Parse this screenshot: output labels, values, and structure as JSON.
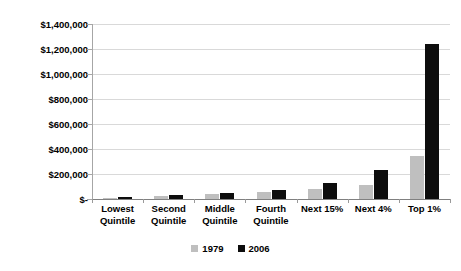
{
  "chart_data": {
    "type": "bar",
    "title": "",
    "subtitle": "",
    "xlabel": "",
    "ylabel": "",
    "categories": [
      "Lowest Quintile",
      "Second Quintile",
      "Middle Quintile",
      "Fourth Quintile",
      "Next 15%",
      "Next 4%",
      "Top 1%"
    ],
    "category_lines": [
      [
        "Lowest",
        "Quintile"
      ],
      [
        "Second",
        "Quintile"
      ],
      [
        "Middle",
        "Quintile"
      ],
      [
        "Fourth",
        "Quintile"
      ],
      [
        "Next 15%"
      ],
      [
        "Next 4%"
      ],
      [
        "Top 1%"
      ]
    ],
    "series": [
      {
        "name": "1979",
        "color": "#bfbfbf",
        "values": [
          11000,
          28000,
          42000,
          58000,
          80000,
          110000,
          345000
        ]
      },
      {
        "name": "2006",
        "color": "#0d0d0d",
        "values": [
          16000,
          36000,
          52000,
          74000,
          130000,
          230000,
          1240000
        ]
      }
    ],
    "ylim": [
      0,
      1400000
    ],
    "ytick_values": [
      0,
      200000,
      400000,
      600000,
      800000,
      1000000,
      1200000,
      1400000
    ],
    "ytick_labels": [
      "$-",
      "$200,000",
      "$400,000",
      "$600,000",
      "$800,000",
      "$1,000,000",
      "$1,200,000",
      "$1,400,000"
    ],
    "grid": true,
    "grid_axis": "y",
    "legend_position": "bottom-center",
    "legend_entries": [
      "1979",
      "2006"
    ]
  }
}
